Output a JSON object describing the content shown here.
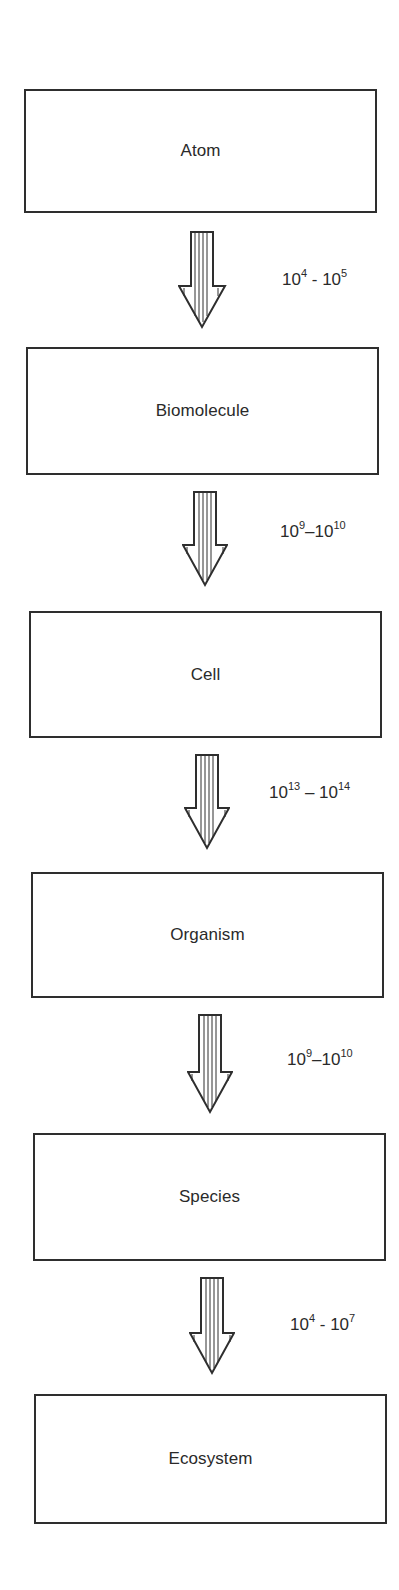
{
  "diagram": {
    "title": "",
    "levels": [
      {
        "label": "Atom"
      },
      {
        "label": "Biomolecule"
      },
      {
        "label": "Cell"
      },
      {
        "label": "Organism"
      },
      {
        "label": "Species"
      },
      {
        "label": "Ecosystem"
      }
    ],
    "transitions": [
      {
        "from": "Atom",
        "to": "Biomolecule",
        "low_base": "10",
        "low_exp": "4",
        "sep": " - ",
        "high_base": "10",
        "high_exp": "5"
      },
      {
        "from": "Biomolecule",
        "to": "Cell",
        "low_base": "10",
        "low_exp": "9",
        "sep": "–",
        "high_base": "10",
        "high_exp": "10"
      },
      {
        "from": "Cell",
        "to": "Organism",
        "low_base": "10",
        "low_exp": "13",
        "sep": " – ",
        "high_base": "10",
        "high_exp": "14"
      },
      {
        "from": "Organism",
        "to": "Species",
        "low_base": "10",
        "low_exp": "9",
        "sep": "–",
        "high_base": "10",
        "high_exp": "10"
      },
      {
        "from": "Species",
        "to": "Ecosystem",
        "low_base": "10",
        "low_exp": "4",
        "sep": " - ",
        "high_base": "10",
        "high_exp": "7"
      }
    ],
    "colors": {
      "stroke": "#2e2e2e",
      "text": "#2a2a2a",
      "background": "#ffffff"
    }
  }
}
